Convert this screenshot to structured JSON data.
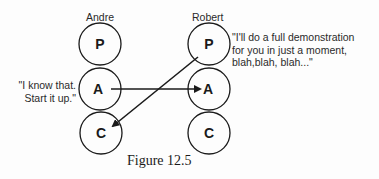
{
  "figure": {
    "caption": "Figure 12.5",
    "people": [
      {
        "name": "Andre",
        "states": [
          "P",
          "A",
          "C"
        ],
        "quote": [
          "\"I know that.",
          "Start it up.\""
        ]
      },
      {
        "name": "Robert",
        "states": [
          "P",
          "A",
          "C"
        ],
        "quote": [
          "\"I'll do a full demonstration",
          "for you in just a moment,",
          "blah,blah, blah...\""
        ]
      }
    ],
    "transactions": [
      {
        "from": "Andre.A",
        "to": "Robert.A",
        "type": "arrow"
      },
      {
        "from": "Robert.P",
        "to": "Andre.C",
        "type": "arrow"
      }
    ],
    "colors": {
      "stroke": "#1a1a1a",
      "background": "#fdfdfd"
    }
  }
}
